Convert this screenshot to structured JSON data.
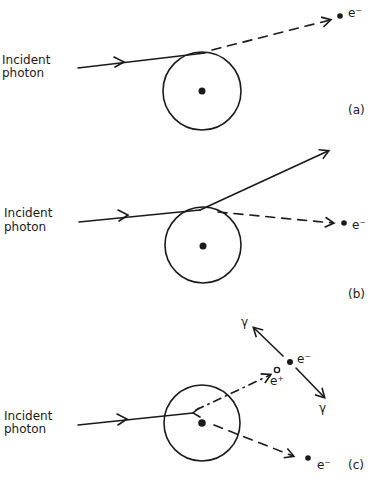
{
  "diagram": {
    "panels": [
      {
        "id": "a",
        "label": "(a)",
        "incident_label_line1": "Incident",
        "incident_label_line2": "photon",
        "outgoing": [
          {
            "particle": "e⁻",
            "line_style": "dashed"
          }
        ]
      },
      {
        "id": "b",
        "label": "(b)",
        "incident_label_line1": "Incident",
        "incident_label_line2": "photon",
        "outgoing": [
          {
            "particle": "scattered photon",
            "line_style": "solid"
          },
          {
            "particle": "e⁻",
            "line_style": "dashed"
          }
        ]
      },
      {
        "id": "c",
        "label": "(c)",
        "incident_label_line1": "Incident",
        "incident_label_line2": "photon",
        "outgoing": [
          {
            "particle": "e⁺",
            "line_style": "dash-dot"
          },
          {
            "particle": "e⁻",
            "line_style": "dashed"
          }
        ],
        "annihilation": {
          "electron": "e⁻",
          "positron": "e⁺",
          "gamma1": "γ",
          "gamma2": "γ"
        }
      }
    ]
  }
}
